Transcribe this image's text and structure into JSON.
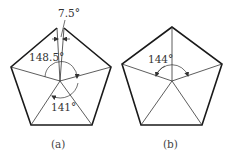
{
  "figures": [
    {
      "id": "a",
      "caption": "(a)",
      "angles": {
        "gap": "7.5°",
        "upper_left": "148.5°",
        "lower": "141°"
      }
    },
    {
      "id": "b",
      "caption": "(b)",
      "angles": {
        "upper": "144°"
      }
    }
  ],
  "colors": {
    "outline": "#1a1a1a",
    "lines": "#333333",
    "background": "#ffffff"
  }
}
